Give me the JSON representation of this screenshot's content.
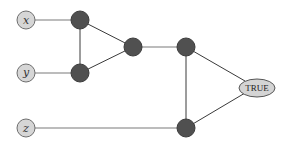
{
  "diagram": {
    "type": "boolean-circuit-graph",
    "inputs": [
      {
        "id": "x",
        "label": "x",
        "cx": 26,
        "cy": 20
      },
      {
        "id": "y",
        "label": "y",
        "cx": 26,
        "cy": 73
      },
      {
        "id": "z",
        "label": "z",
        "cx": 26,
        "cy": 128
      }
    ],
    "gates": [
      {
        "id": "g1",
        "cx": 80,
        "cy": 20
      },
      {
        "id": "g2",
        "cx": 80,
        "cy": 73
      },
      {
        "id": "g3",
        "cx": 133,
        "cy": 47
      },
      {
        "id": "g4",
        "cx": 186,
        "cy": 47
      },
      {
        "id": "g5",
        "cx": 186,
        "cy": 128
      }
    ],
    "output": {
      "id": "out",
      "label": "TRUE",
      "cx": 257,
      "cy": 87
    },
    "edges": [
      [
        "x",
        "g1"
      ],
      [
        "y",
        "g2"
      ],
      [
        "z",
        "g5"
      ],
      [
        "g1",
        "g2"
      ],
      [
        "g1",
        "g3"
      ],
      [
        "g2",
        "g3"
      ],
      [
        "g3",
        "g4"
      ],
      [
        "g4",
        "g5"
      ],
      [
        "g4",
        "out"
      ],
      [
        "g5",
        "out"
      ]
    ]
  }
}
